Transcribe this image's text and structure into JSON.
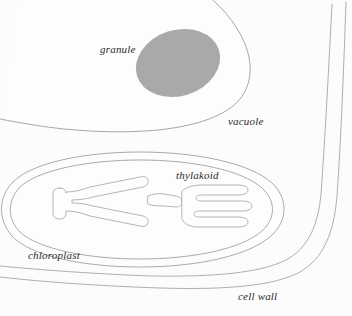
{
  "figure": {
    "background_color": "#fcfcfc",
    "line_color": "#9a9a9a",
    "label_color": "#2b2b2b",
    "width": 352,
    "height": 316
  },
  "labels": {
    "granule": "granule",
    "vacuole": "vacuole",
    "thylakoid": "thylakoid",
    "chloroplast": "chloroplast",
    "cell_wall": "cell wall"
  },
  "structures": {
    "vacuole": {
      "name": "vacuole",
      "fill": "#fdfdfd",
      "stroke": "#9d9d9d",
      "stroke_width": 0.9
    },
    "granule": {
      "name": "granule",
      "fill": "#a9a9a9",
      "stroke": "none",
      "center_x": 178,
      "center_y": 63,
      "radius_x": 43,
      "radius_y": 33,
      "rotation_deg": -18
    },
    "chloroplast": {
      "name": "chloroplast",
      "fill": "#fdfdfd",
      "stroke": "#a2a2a2",
      "stroke_width": 0.9,
      "membrane_layers": 2
    },
    "thylakoid": {
      "name": "thylakoid",
      "fill": "#fdfdfd",
      "stroke": "#a8a8a8",
      "stroke_width": 0.85,
      "lobes": 2
    },
    "cell_wall": {
      "name": "cell wall",
      "stroke": "#a5a5a5",
      "stroke_width": 0.9,
      "line_count": 2
    }
  }
}
